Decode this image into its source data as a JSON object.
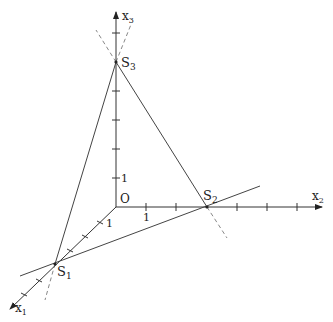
{
  "diagram": {
    "type": "3d-coordinate-system",
    "origin_label": "O",
    "axes": [
      {
        "id": "x1",
        "label": "x",
        "subscript": "1"
      },
      {
        "id": "x2",
        "label": "x",
        "subscript": "2"
      },
      {
        "id": "x3",
        "label": "x",
        "subscript": "3"
      }
    ],
    "unit_labels": {
      "x1": "1",
      "x2": "1",
      "x3": "1"
    },
    "points": [
      {
        "id": "S1",
        "label": "S",
        "subscript": "1",
        "axis": "x1",
        "coordinate": 4
      },
      {
        "id": "S2",
        "label": "S",
        "subscript": "2",
        "axis": "x2",
        "coordinate": 3
      },
      {
        "id": "S3",
        "label": "S",
        "subscript": "3",
        "axis": "x3",
        "coordinate": 5
      }
    ],
    "colors": {
      "axis": "#333333",
      "line": "#444444",
      "dashed": "#777777"
    }
  }
}
